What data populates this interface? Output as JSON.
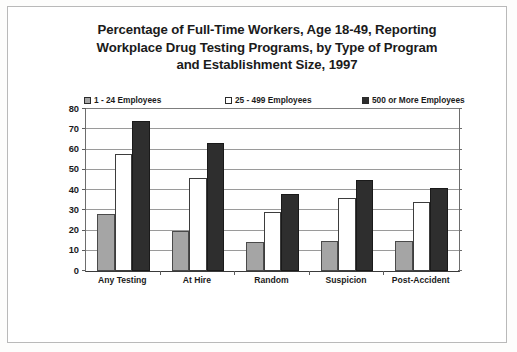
{
  "chart_data": {
    "type": "bar",
    "title": "Percentage of Full-Time Workers, Age 18-49, Reporting Workplace Drug Testing Programs, by Type of Program and Establishment Size, 1997",
    "title_lines": [
      "Percentage of Full-Time Workers, Age 18-49, Reporting",
      "Workplace Drug Testing Programs, by Type of Program",
      "and Establishment Size, 1997"
    ],
    "categories": [
      "Any Testing",
      "At Hire",
      "Random",
      "Suspicion",
      "Post-Accident"
    ],
    "series": [
      {
        "name": "1 - 24 Employees",
        "color": "#a5a5a5",
        "values": [
          28,
          20,
          14.5,
          15,
          15
        ]
      },
      {
        "name": "25 - 499 Employees",
        "color": "#ffffff",
        "values": [
          58,
          46,
          29,
          36,
          34
        ]
      },
      {
        "name": "500 or More Employees",
        "color": "#2e2e2e",
        "values": [
          74,
          63,
          38,
          45,
          41
        ]
      }
    ],
    "xlabel": "",
    "ylabel": "",
    "ylim": [
      0,
      80
    ],
    "yticks": [
      0,
      10,
      20,
      30,
      40,
      50,
      60,
      70,
      80
    ],
    "grid": true,
    "legend_position": "top"
  },
  "legend": {
    "items": [
      {
        "label": "1 - 24 Employees",
        "color": "#a5a5a5"
      },
      {
        "label": "25 - 499 Employees",
        "color": "#ffffff"
      },
      {
        "label": "500 or More Employees",
        "color": "#2e2e2e"
      }
    ]
  }
}
